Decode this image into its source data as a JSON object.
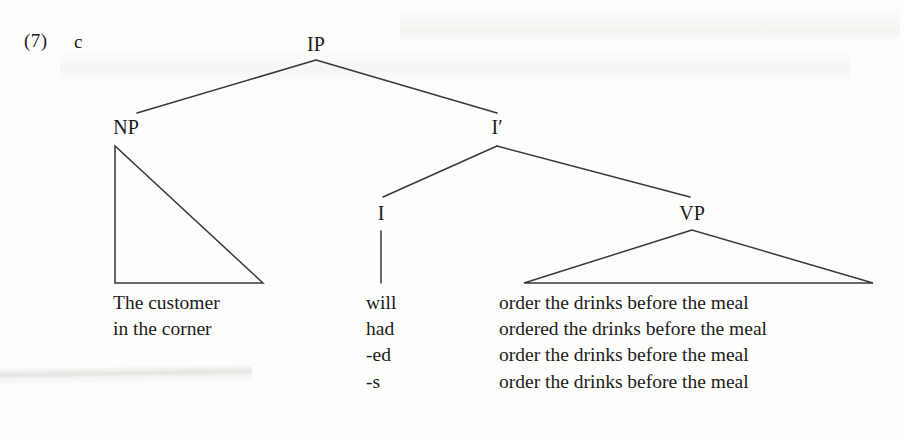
{
  "document": {
    "example_number": "(7)",
    "example_letter": "c"
  },
  "tree": {
    "nodes": [
      {
        "id": "ip",
        "label": "IP",
        "x": 316,
        "y": 45
      },
      {
        "id": "np",
        "label": "NP",
        "x": 126,
        "y": 128
      },
      {
        "id": "ibar",
        "label": "I′",
        "x": 497,
        "y": 128
      },
      {
        "id": "i",
        "label": "I",
        "x": 381,
        "y": 214
      },
      {
        "id": "vp",
        "label": "VP",
        "x": 692,
        "y": 214
      }
    ],
    "line_color": "#3b3937"
  },
  "terminals": {
    "np_phrase": [
      "The customer",
      "in the corner"
    ],
    "inflection": [
      "will",
      "had",
      "-ed",
      "-s"
    ],
    "verb_phrase": [
      "order the drinks before the meal",
      "ordered the drinks before the meal",
      "order the drinks before the meal",
      "order the drinks before the meal"
    ]
  }
}
